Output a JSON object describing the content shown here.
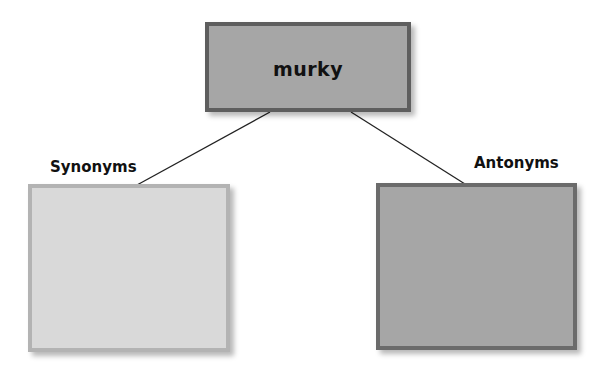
{
  "diagram": {
    "type": "word-map",
    "center_word": {
      "text": "murky",
      "fill": "#a6a6a6",
      "border": "#5e5e5e"
    },
    "branches": [
      {
        "label": "Synonyms",
        "fill": "#d9d9d9",
        "border": "#b3b3b3",
        "content": ""
      },
      {
        "label": "Antonyms",
        "fill": "#a6a6a6",
        "border": "#6b6b6b",
        "content": ""
      }
    ],
    "connector_color": "#222222"
  }
}
